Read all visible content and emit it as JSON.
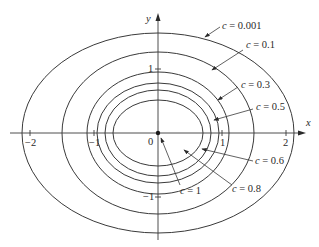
{
  "figure": {
    "axes": {
      "x_label": "x",
      "y_label": "y",
      "origin_label": "0",
      "x_ticks": [
        "−2",
        "−1",
        "1",
        "2"
      ],
      "y_ticks": [
        "1",
        "−1"
      ]
    },
    "curves": [
      {
        "c_label": "c = 0.001"
      },
      {
        "c_label": "c = 0.1"
      },
      {
        "c_label": "c = 0.3"
      },
      {
        "c_label": "c = 0.5"
      },
      {
        "c_label": "c = 0.6"
      },
      {
        "c_label": "c = 0.8"
      },
      {
        "c_label": "c = 1"
      }
    ],
    "colors": {
      "line": "#3a3a3a",
      "background": "#ffffff"
    }
  }
}
